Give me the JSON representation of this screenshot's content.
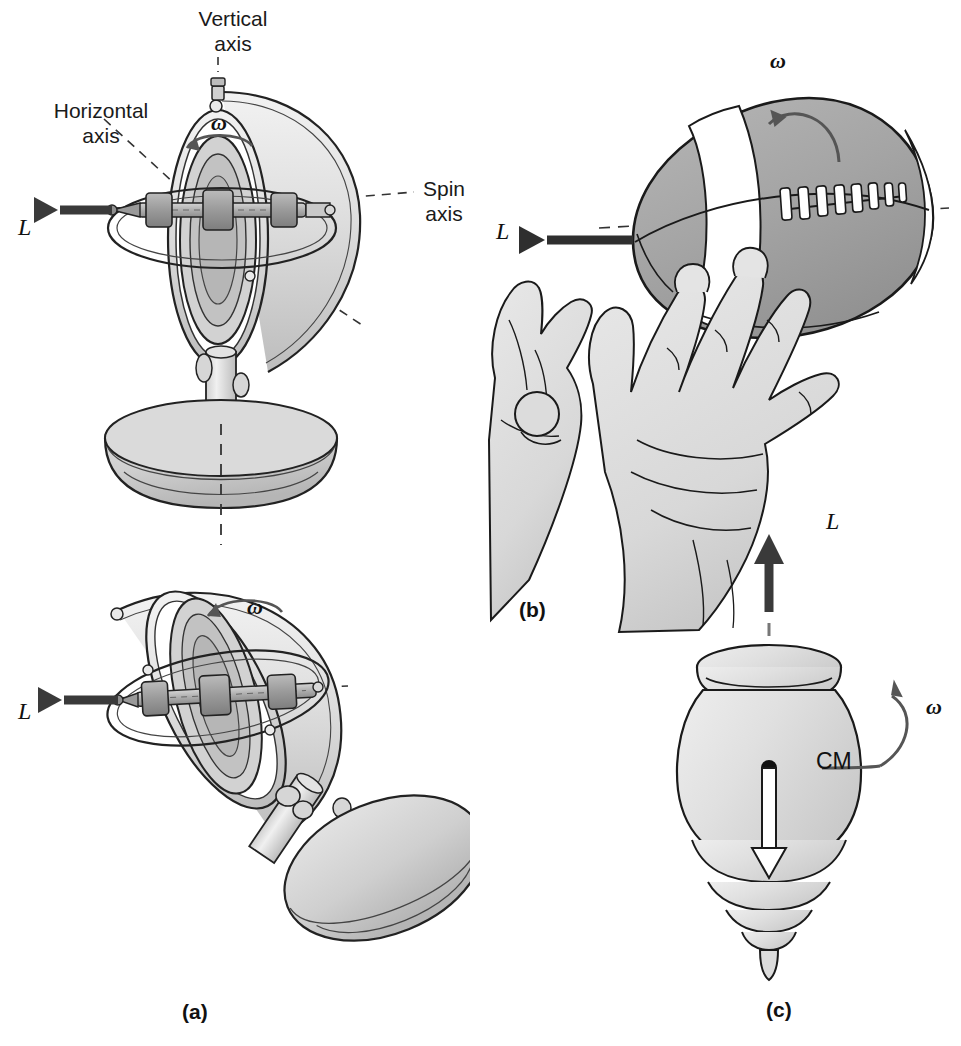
{
  "figure": {
    "background_color": "#ffffff",
    "ink_color": "#1a1a1a",
    "fill_light": "#dcdcdc",
    "fill_mid": "#b4b4b4",
    "fill_dark": "#8c8c8c",
    "arrow_color": "#3a3a3a"
  },
  "panels": [
    {
      "id": "a",
      "label": "(a)",
      "caption_position": {
        "x": 182,
        "y": 1002
      },
      "description": "Gimbal-mounted gyroscope shown upright and tilted on a domed pedestal base"
    },
    {
      "id": "b",
      "label": "(b)",
      "caption_position": {
        "x": 519,
        "y": 600
      },
      "description": "Two hands releasing a spiraling football"
    },
    {
      "id": "c",
      "label": "(c)",
      "caption_position": {
        "x": 766,
        "y": 1000
      },
      "description": "Spinning top with center of mass and weight vector"
    }
  ],
  "annotations": {
    "vertical_axis": {
      "text": "Vertical\naxis",
      "x": 178,
      "y": 8
    },
    "horizontal_axis": {
      "text": "Horizontal\naxis",
      "x": 28,
      "y": 100
    },
    "spin_axis": {
      "text": "Spin\naxis",
      "x": 412,
      "y": 179
    },
    "cm": {
      "text": "CM",
      "x": 817,
      "y": 750
    }
  },
  "vectors": [
    {
      "name": "L-gyro-upright",
      "symbol": "L",
      "x": 18,
      "y": 216,
      "direction": "left"
    },
    {
      "name": "L-gyro-tilted",
      "symbol": "L",
      "x": 18,
      "y": 700,
      "direction": "left"
    },
    {
      "name": "L-football",
      "symbol": "L",
      "x": 496,
      "y": 220,
      "direction": "left"
    },
    {
      "name": "L-top",
      "symbol": "L",
      "x": 827,
      "y": 513,
      "direction": "up"
    }
  ],
  "omegas": [
    {
      "name": "omega-gyro-upright",
      "symbol": "ω",
      "x": 211,
      "y": 113,
      "rotation": "counterclockwise"
    },
    {
      "name": "omega-gyro-tilted",
      "symbol": "ω",
      "x": 247,
      "y": 597,
      "rotation": "counterclockwise"
    },
    {
      "name": "omega-football",
      "symbol": "ω",
      "x": 770,
      "y": 51,
      "rotation": "counterclockwise"
    },
    {
      "name": "omega-top",
      "symbol": "ω",
      "x": 926,
      "y": 698,
      "rotation": "counterclockwise"
    }
  ]
}
